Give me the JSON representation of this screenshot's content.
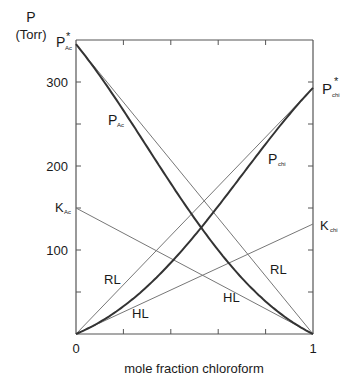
{
  "chart_data": {
    "type": "line",
    "title": "",
    "xlabel": "mole fraction chloroform",
    "ylabel": "P",
    "ylabel_unit": "(Torr)",
    "xlim": [
      0,
      1
    ],
    "ylim": [
      0,
      350
    ],
    "x_tick_labels": [
      "0",
      "1"
    ],
    "x_minor_ticks": [
      0.2,
      0.4,
      0.6,
      0.8
    ],
    "y_tick_labels": [
      "100",
      "200",
      "300"
    ],
    "y_ticks": [
      50,
      100,
      150,
      200,
      250,
      300
    ],
    "grid": false,
    "legend": "none (inline labels)",
    "constants": {
      "P_Ac_star": 345,
      "P_chi_star": 293,
      "K_Ac": 150,
      "K_chi": 131,
      "margules_A": -0.9
    },
    "series": [
      {
        "name": "P_Ac",
        "style": "thick",
        "description": "Partial pressure of acetone (negative deviation)",
        "points": [
          [
            0,
            345
          ],
          [
            0.1,
            308
          ],
          [
            0.2,
            268
          ],
          [
            0.3,
            228
          ],
          [
            0.4,
            189
          ],
          [
            0.5,
            148
          ],
          [
            0.54,
            126
          ],
          [
            0.6,
            111
          ],
          [
            0.7,
            78
          ],
          [
            0.8,
            48
          ],
          [
            0.9,
            22
          ],
          [
            1,
            0
          ]
        ]
      },
      {
        "name": "P_chi",
        "style": "thick",
        "description": "Partial pressure of chloroform (negative deviation)",
        "points": [
          [
            0,
            0
          ],
          [
            0.1,
            13
          ],
          [
            0.2,
            33
          ],
          [
            0.3,
            56
          ],
          [
            0.4,
            84
          ],
          [
            0.5,
            114
          ],
          [
            0.54,
            126
          ],
          [
            0.6,
            144
          ],
          [
            0.7,
            183
          ],
          [
            0.8,
            223
          ],
          [
            0.9,
            262
          ],
          [
            1,
            293
          ]
        ]
      },
      {
        "name": "RL_Ac",
        "style": "thin",
        "description": "Raoult's law line for acetone",
        "points": [
          [
            0,
            345
          ],
          [
            1,
            0
          ]
        ]
      },
      {
        "name": "RL_chi",
        "style": "thin",
        "description": "Raoult's law line for chloroform",
        "points": [
          [
            0,
            0
          ],
          [
            1,
            293
          ]
        ]
      },
      {
        "name": "HL_Ac",
        "style": "thin",
        "description": "Henry's law line for acetone",
        "points": [
          [
            0,
            150
          ],
          [
            1,
            0
          ]
        ]
      },
      {
        "name": "HL_chi",
        "style": "thin",
        "description": "Henry's law line for chloroform",
        "points": [
          [
            0,
            0
          ],
          [
            1,
            131
          ]
        ]
      }
    ],
    "annotations": [
      {
        "text": "P",
        "sub": "Ac",
        "sup": "*",
        "at": "top-left y-intercept"
      },
      {
        "text": "P",
        "sub": "chi",
        "sup": "*",
        "at": "right y-intercept"
      },
      {
        "text": "K",
        "sub": "Ac",
        "at": "left, y=150"
      },
      {
        "text": "K",
        "sub": "chi",
        "at": "right, y=131"
      },
      {
        "text": "P",
        "sub": "Ac",
        "at": "on acetone curve"
      },
      {
        "text": "P",
        "sub": "chi",
        "at": "on chloroform curve"
      },
      {
        "text": "RL",
        "at": "left, chloroform Raoult line"
      },
      {
        "text": "HL",
        "at": "left, chloroform Henry line"
      },
      {
        "text": "RL",
        "at": "right, acetone Raoult line"
      },
      {
        "text": "HL",
        "at": "right, acetone Henry line"
      }
    ]
  },
  "labels": {
    "y_axis_title": "P",
    "y_axis_unit": "(Torr)",
    "x_axis_title": "mole fraction chloroform",
    "x0": "0",
    "x1": "1",
    "y100": "100",
    "y200": "200",
    "y300": "300",
    "p_ac_star_main": "P",
    "p_ac_star_sub": "Ac",
    "p_chi_star_main": "P",
    "p_chi_star_sub": "chi",
    "star": "*",
    "k_ac_main": "K",
    "k_ac_sub": "Ac",
    "k_chi_main": "K",
    "k_chi_sub": "chi",
    "p_ac_main": "P",
    "p_ac_sub": "Ac",
    "p_chi_main": "P",
    "p_chi_sub": "chi",
    "rl_left": "RL",
    "hl_left": "HL",
    "rl_right": "RL",
    "hl_right": "HL"
  },
  "colors": {
    "axis": "#555555",
    "thick_curve": "#333333",
    "thin_line": "#777777",
    "text": "#1a1a1a"
  }
}
